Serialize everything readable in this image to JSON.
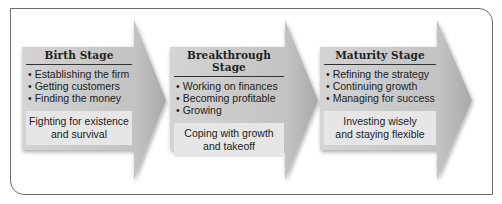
{
  "diagram": {
    "type": "process-flow",
    "colors": {
      "arrow": "#bdbdbd",
      "summary_box": "#e6e6e6",
      "frame": "#6a6a6a"
    },
    "stages": [
      {
        "title": "Birth Stage",
        "items": [
          "Establishing the firm",
          "Getting customers",
          "Finding the money"
        ],
        "summary_line1": "Fighting for existence",
        "summary_line2": "and survival"
      },
      {
        "title": "Breakthrough Stage",
        "items": [
          "Working on finances",
          "Becoming profitable",
          "Growing"
        ],
        "summary_line1": "Coping with growth",
        "summary_line2": "and takeoff"
      },
      {
        "title": "Maturity Stage",
        "items": [
          "Refining the strategy",
          "Continuing growth",
          "Managing for success"
        ],
        "summary_line1": "Investing wisely",
        "summary_line2": "and staying flexible"
      }
    ]
  }
}
